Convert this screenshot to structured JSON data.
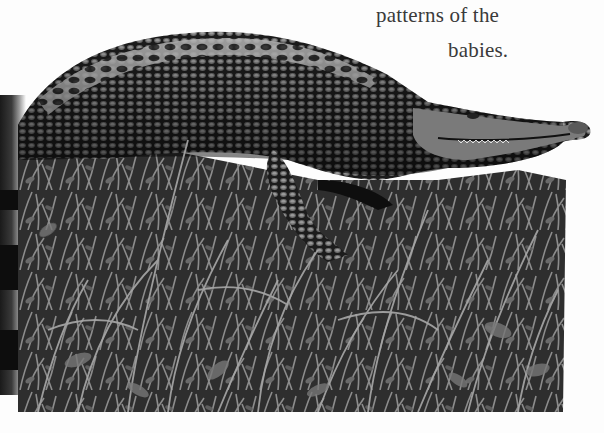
{
  "document": {
    "type": "book page scan",
    "text_lines": [
      "patterns of the",
      "babies."
    ],
    "figure": {
      "subject": "crocodile lying on grass",
      "rendering": "grayscale photograph cutout"
    },
    "colors": {
      "page": "#fdfdfd",
      "text": "#3a3a3a",
      "gutter_shadow": "#1a1a1a",
      "scales_dark": "#141414",
      "scales_light": "#8a8a8a",
      "grass": "#4a4a4a"
    }
  }
}
